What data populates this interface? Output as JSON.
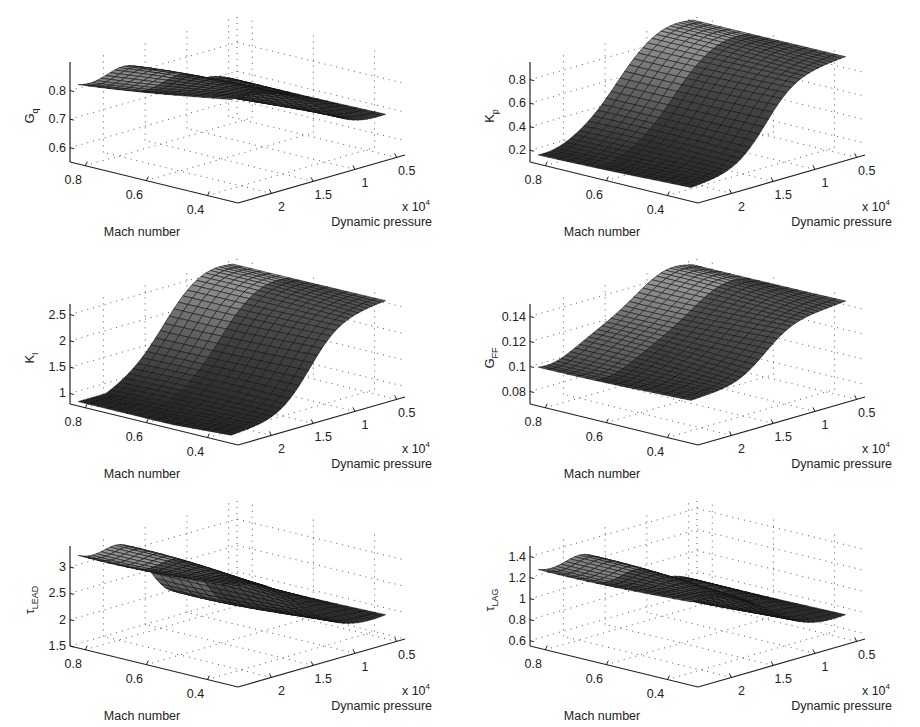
{
  "chart_data": [
    {
      "type": "surface",
      "id": "Gq",
      "zlabel": "G",
      "zlabel_sub": "q",
      "xlabel": "Mach number",
      "ylabel": "Dynamic pressure",
      "y_multiplier": "x 10",
      "y_multiplier_exp": "4",
      "mach_ticks": [
        "0.8",
        "0.6",
        "0.4"
      ],
      "mach_tick_values": [
        0.8,
        0.6,
        0.4
      ],
      "mach_range": [
        0.3,
        0.85
      ],
      "q_ticks": [
        "2",
        "1.5",
        "1",
        "0.5"
      ],
      "q_tick_values": [
        2,
        1.5,
        1,
        0.5
      ],
      "q_range": [
        0.4,
        2.4
      ],
      "z_ticks": [
        "0.6",
        "0.7",
        "0.8"
      ],
      "z_tick_values": [
        0.6,
        0.7,
        0.8
      ],
      "zlim": [
        0.55,
        0.9
      ],
      "grid": true,
      "surface": {
        "mach": [
          0.85,
          0.35
        ],
        "q": [
          2.3,
          0.45
        ],
        "z_high_q": 0.89,
        "z_low_q": 0.68,
        "transition_q": 1.3,
        "mach_drop": 0.3,
        "wiggle": 0.02
      }
    },
    {
      "type": "surface",
      "id": "Kp",
      "zlabel": "K",
      "zlabel_sub": "p",
      "xlabel": "Mach number",
      "ylabel": "Dynamic pressure",
      "y_multiplier": "x 10",
      "y_multiplier_exp": "4",
      "mach_ticks": [
        "0.8",
        "0.6",
        "0.4"
      ],
      "mach_tick_values": [
        0.8,
        0.6,
        0.4
      ],
      "mach_range": [
        0.3,
        0.85
      ],
      "q_ticks": [
        "2",
        "1.5",
        "1",
        "0.5"
      ],
      "q_tick_values": [
        2,
        1.5,
        1,
        0.5
      ],
      "q_range": [
        0.4,
        2.4
      ],
      "z_ticks": [
        "0.2",
        "0.4",
        "0.6",
        "0.8"
      ],
      "z_tick_values": [
        0.2,
        0.4,
        0.6,
        0.8
      ],
      "zlim": [
        0.1,
        0.95
      ],
      "grid": true,
      "surface": {
        "mach": [
          0.85,
          0.35
        ],
        "q": [
          2.3,
          0.45
        ],
        "z_high_q": 0.17,
        "z_low_q": 0.92,
        "transition_q": 1.4,
        "mach_drop": 0.05,
        "wiggle": 0.02
      }
    },
    {
      "type": "surface",
      "id": "KI",
      "zlabel": "K",
      "zlabel_sub": "I",
      "xlabel": "Mach number",
      "ylabel": "Dynamic pressure",
      "y_multiplier": "x 10",
      "y_multiplier_exp": "4",
      "mach_ticks": [
        "0.8",
        "0.6",
        "0.4"
      ],
      "mach_tick_values": [
        0.8,
        0.6,
        0.4
      ],
      "mach_range": [
        0.3,
        0.85
      ],
      "q_ticks": [
        "2",
        "1.5",
        "1",
        "0.5"
      ],
      "q_tick_values": [
        2,
        1.5,
        1,
        0.5
      ],
      "q_range": [
        0.4,
        2.4
      ],
      "z_ticks": [
        "1",
        "1.5",
        "2",
        "2.5"
      ],
      "z_tick_values": [
        1,
        1.5,
        2,
        2.5
      ],
      "zlim": [
        0.8,
        2.7
      ],
      "grid": true,
      "surface": {
        "mach": [
          0.85,
          0.35
        ],
        "q": [
          2.3,
          0.45
        ],
        "z_high_q": 0.85,
        "z_low_q": 2.6,
        "transition_q": 1.35,
        "mach_drop": 0.1,
        "wiggle": 0.05
      }
    },
    {
      "type": "surface",
      "id": "GFF",
      "zlabel": "G",
      "zlabel_sub": "FF",
      "xlabel": "Mach number",
      "ylabel": "Dynamic pressure",
      "y_multiplier": "x 10",
      "y_multiplier_exp": "4",
      "mach_ticks": [
        "0.8",
        "0.6",
        "0.4"
      ],
      "mach_tick_values": [
        0.8,
        0.6,
        0.4
      ],
      "mach_range": [
        0.3,
        0.85
      ],
      "q_ticks": [
        "2",
        "1.5",
        "1",
        "0.5"
      ],
      "q_tick_values": [
        2,
        1.5,
        1,
        0.5
      ],
      "q_range": [
        0.4,
        2.4
      ],
      "z_ticks": [
        "0.08",
        "0.1",
        "0.12",
        "0.14"
      ],
      "z_tick_values": [
        0.08,
        0.1,
        0.12,
        0.14
      ],
      "zlim": [
        0.07,
        0.15
      ],
      "grid": true,
      "surface": {
        "mach": [
          0.85,
          0.35
        ],
        "q": [
          2.3,
          0.45
        ],
        "z_high_q": 0.1,
        "z_low_q": 0.145,
        "transition_q": 1.4,
        "mach_drop": 0.02,
        "wiggle": 0.003
      }
    },
    {
      "type": "surface",
      "id": "tauLEAD",
      "zlabel": "τ",
      "zlabel_sub": "LEAD",
      "xlabel": "Mach number",
      "ylabel": "Dynamic pressure",
      "y_multiplier": "x 10",
      "y_multiplier_exp": "4",
      "mach_ticks": [
        "0.8",
        "0.6",
        "0.4"
      ],
      "mach_tick_values": [
        0.8,
        0.6,
        0.4
      ],
      "mach_range": [
        0.3,
        0.85
      ],
      "q_ticks": [
        "2",
        "1.5",
        "1",
        "0.5"
      ],
      "q_tick_values": [
        2,
        1.5,
        1,
        0.5
      ],
      "q_range": [
        0.4,
        2.4
      ],
      "z_ticks": [
        "1.5",
        "2",
        "2.5",
        "3"
      ],
      "z_tick_values": [
        1.5,
        2,
        2.5,
        3
      ],
      "zlim": [
        1.5,
        3.4
      ],
      "grid": true,
      "surface": {
        "mach": [
          0.85,
          0.35
        ],
        "q": [
          2.3,
          0.45
        ],
        "z_high_q": 3.3,
        "z_low_q": 1.9,
        "transition_q": 1.5,
        "mach_drop": 0.0,
        "wiggle": 0.15
      }
    },
    {
      "type": "surface",
      "id": "tauLAG",
      "zlabel": "τ",
      "zlabel_sub": "LAG",
      "xlabel": "Mach number",
      "ylabel": "Dynamic pressure",
      "y_multiplier": "x 10",
      "y_multiplier_exp": "4",
      "mach_ticks": [
        "0.8",
        "0.6",
        "0.4"
      ],
      "mach_tick_values": [
        0.8,
        0.6,
        0.4
      ],
      "mach_range": [
        0.3,
        0.85
      ],
      "q_ticks": [
        "2",
        "1.5",
        "1",
        "0.5"
      ],
      "q_tick_values": [
        2,
        1.5,
        1,
        0.5
      ],
      "q_range": [
        0.4,
        2.4
      ],
      "z_ticks": [
        "0.6",
        "0.8",
        "1",
        "1.2",
        "1.4"
      ],
      "z_tick_values": [
        0.6,
        0.8,
        1,
        1.2,
        1.4
      ],
      "zlim": [
        0.55,
        1.5
      ],
      "grid": true,
      "surface": {
        "mach": [
          0.85,
          0.35
        ],
        "q": [
          2.3,
          0.45
        ],
        "z_high_q": 1.3,
        "z_low_q": 0.75,
        "transition_q": 1.4,
        "mach_drop": 0.0,
        "wiggle": 0.06
      }
    }
  ]
}
